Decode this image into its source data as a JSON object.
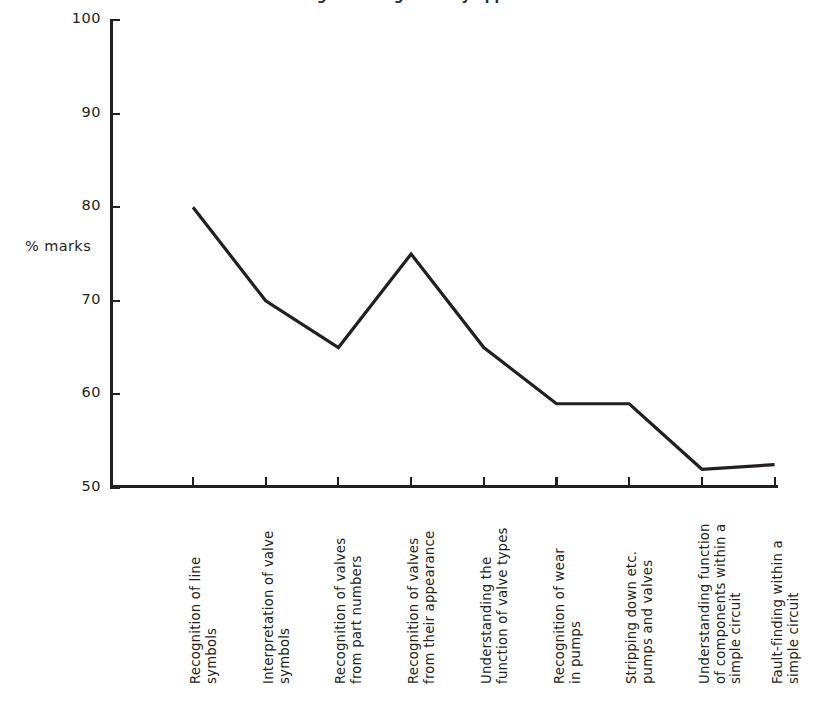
{
  "chart_data": {
    "type": "line",
    "title": "Percentage marks gained by apprentices",
    "title_clipped": true,
    "xlabel": "",
    "ylabel": "% marks",
    "ylim": [
      50,
      100
    ],
    "yticks": [
      100,
      90,
      80,
      70,
      60,
      50
    ],
    "grid": false,
    "legend": false,
    "categories": [
      "Recognition of line\nsymbols",
      "Interpretation of valve\nsymbols",
      "Recognition of valves\nfrom part numbers",
      "Recognition of valves\nfrom their appearance",
      "Understanding the\nfunction of valve types",
      "Recognition of wear\nin pumps",
      "Stripping down etc.\npumps and valves",
      "Understanding function\nof components within a\nsimple circuit",
      "Fault-finding within a\nsimple circuit"
    ],
    "values": [
      80,
      70,
      65,
      75,
      65,
      59,
      59,
      52,
      52.5
    ],
    "line_color": "#231f20",
    "line_width": 3.2
  },
  "axis": {
    "y_label": "% marks",
    "y_tick_labels": [
      "100",
      "90",
      "80",
      "70",
      "60",
      "50"
    ]
  }
}
